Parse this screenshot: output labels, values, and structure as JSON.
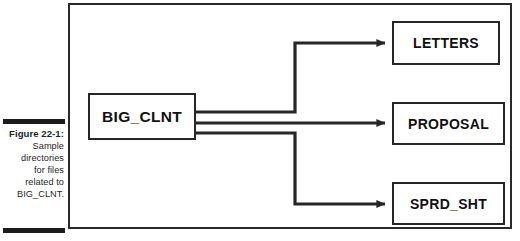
{
  "figure": {
    "caption_label": "Figure 22-1:",
    "caption_lines": [
      "Sample",
      "directories",
      "for files",
      "related to",
      "BIG_CLNT."
    ]
  },
  "diagram": {
    "type": "tree",
    "root": {
      "id": "big-clnt",
      "label": "BIG_CLNT"
    },
    "children": [
      {
        "id": "letters",
        "label": "LETTERS"
      },
      {
        "id": "proposal",
        "label": "PROPOSAL"
      },
      {
        "id": "sprd-sht",
        "label": "SPRD_SHT"
      }
    ],
    "connectors": [
      {
        "from": "big-clnt",
        "to": "letters",
        "style": "elbow-up",
        "arrow": "arrowhead-right"
      },
      {
        "from": "big-clnt",
        "to": "proposal",
        "style": "straight",
        "arrow": "arrowhead-right"
      },
      {
        "from": "big-clnt",
        "to": "sprd-sht",
        "style": "elbow-down",
        "arrow": "arrowhead-right"
      }
    ],
    "colors": {
      "line": "#262626",
      "frame": "#2a2a2a",
      "text": "#111111",
      "background": "#ffffff"
    }
  }
}
